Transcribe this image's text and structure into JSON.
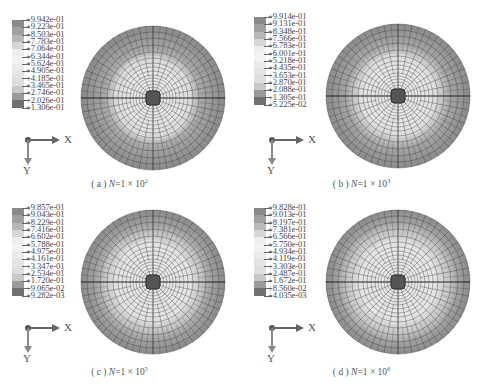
{
  "figure": {
    "panels": [
      {
        "id": "a",
        "caption_prefix": "( a )",
        "caption_var": "N",
        "caption_eq": "=1 × 10",
        "caption_exp": "2",
        "legend": [
          "+9.942e-01",
          "+9.223e-01",
          "+8.503e-01",
          "+7.783e-01",
          "+7.064e-01",
          "+6.344e-01",
          "+5.624e-01",
          "+4.905e-01",
          "+4.185e-01",
          "+3.465e-01",
          "+2.746e-01",
          "+2.026e-01",
          "+1.306e-01"
        ],
        "axis_x": "X",
        "axis_y": "Y"
      },
      {
        "id": "b",
        "caption_prefix": "( b )",
        "caption_var": "N",
        "caption_eq": "=1 × 10",
        "caption_exp": "3",
        "legend": [
          "+9.914e-01",
          "+9.131e-01",
          "+8.348e-01",
          "+7.566e-01",
          "+6.783e-01",
          "+6.001e-01",
          "+5.218e-01",
          "+4.435e-01",
          "+3.653e-01",
          "+2.870e-01",
          "+2.088e-01",
          "+1.305e-01",
          "+5.225e-02"
        ],
        "axis_x": "X",
        "axis_y": "Y"
      },
      {
        "id": "c",
        "caption_prefix": "( c )",
        "caption_var": "N",
        "caption_eq": "=1 × 10",
        "caption_exp": "5",
        "legend": [
          "+9.857e-01",
          "+9.043e-01",
          "+8.229e-01",
          "+7.416e-01",
          "+6.602e-01",
          "+5.788e-01",
          "+4.975e-01",
          "+4.161e-01",
          "+3.347e-01",
          "+2.534e-01",
          "+1.720e-01",
          "+9.065e-02",
          "+9.282e-03"
        ],
        "axis_x": "X",
        "axis_y": "Y"
      },
      {
        "id": "d",
        "caption_prefix": "( d )",
        "caption_var": "N",
        "caption_eq": "=1 × 10",
        "caption_exp": "6",
        "legend": [
          "+9.828e-01",
          "+9.013e-01",
          "+8.197e-01",
          "+7.381e-01",
          "+6.566e-01",
          "+5.750e-01",
          "+4.934e-01",
          "+4.119e-01",
          "+3.303e-01",
          "+2.487e-01",
          "+1.672e-01",
          "+8.560e-02",
          "+4.035e-03"
        ],
        "axis_x": "X",
        "axis_y": "Y"
      }
    ],
    "legend_colors": [
      "#8a8a8a",
      "#a0a0a0",
      "#b8b8b8",
      "#d6d6d6",
      "#eeeeee",
      "#f2f2f2",
      "#eaeaea",
      "#e4e4e4",
      "#dedede",
      "#c8c8c8",
      "#9a9a9a",
      "#707070",
      "#505050"
    ],
    "plot_colors": {
      "outer_ring": "#8c8c8c",
      "mid_ring": "#a8a8a8",
      "inner_light": "#d8d8d8",
      "center_dark": "#555555",
      "mesh_line": "#2e2e2e"
    }
  }
}
